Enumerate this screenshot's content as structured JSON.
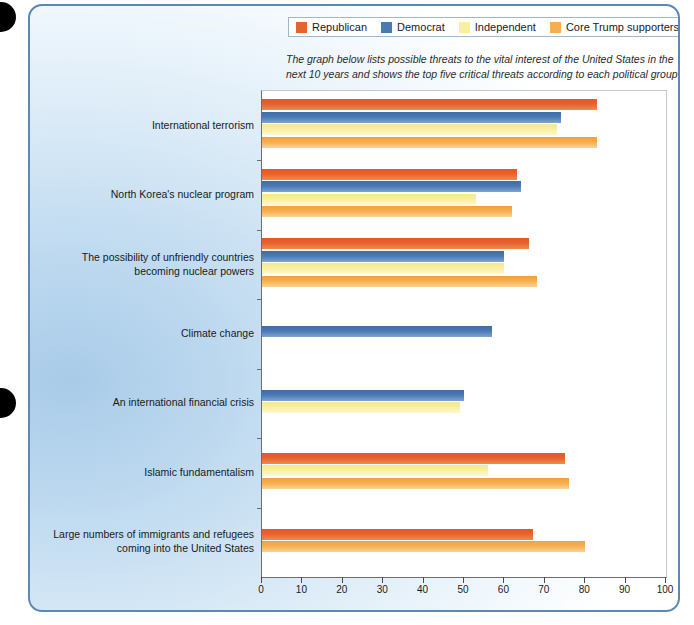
{
  "legend": {
    "items": [
      {
        "label": "Republican",
        "color": "#e4632f"
      },
      {
        "label": "Democrat",
        "color": "#4a79b4"
      },
      {
        "label": "Independent",
        "color": "#f8ef9f"
      },
      {
        "label": "Core Trump supporters",
        "color": "#f5ae51"
      }
    ]
  },
  "subtitle": "The graph below lists possible threats to the vital interest of the United States in the next 10 years and shows the top five critical threats according to each political group",
  "chart_data": {
    "type": "bar",
    "orientation": "horizontal",
    "title": "",
    "subtitle": "The graph below lists possible threats to the vital interest of the United States in the next 10 years and shows the top five critical threats according to each political group",
    "xlabel": "",
    "ylabel": "",
    "xlim": [
      0,
      100
    ],
    "xticks": [
      0,
      10,
      20,
      30,
      40,
      50,
      60,
      70,
      80,
      90,
      100
    ],
    "grid": false,
    "legend_position": "top",
    "categories": [
      "International terrorism",
      "North Korea's nuclear program",
      "The possibility of unfriendly countries becoming nuclear powers",
      "Climate change",
      "An international financial crisis",
      "Islamic fundamentalism",
      "Large numbers of immigrants and refugees coming into the United States"
    ],
    "category_lines": [
      [
        "International terrorism"
      ],
      [
        "North Korea's nuclear program"
      ],
      [
        "The possibility of unfriendly countries",
        "becoming nuclear powers"
      ],
      [
        "Climate change"
      ],
      [
        "An international financial crisis"
      ],
      [
        "Islamic fundamentalism"
      ],
      [
        "Large numbers of immigrants and refugees",
        "coming into the United States"
      ]
    ],
    "series": [
      {
        "name": "Republican",
        "color": "#e4632f",
        "values": [
          83,
          63,
          66,
          null,
          null,
          75,
          67
        ]
      },
      {
        "name": "Democrat",
        "color": "#4a79b4",
        "values": [
          74,
          64,
          60,
          57,
          50,
          null,
          null
        ]
      },
      {
        "name": "Independent",
        "color": "#f8ef9f",
        "values": [
          73,
          53,
          60,
          null,
          49,
          56,
          null
        ]
      },
      {
        "name": "Core Trump supporters",
        "color": "#f5ae51",
        "values": [
          83,
          62,
          68,
          null,
          null,
          76,
          80
        ]
      }
    ]
  },
  "xaxis": {
    "ticks": [
      "0",
      "10",
      "20",
      "30",
      "40",
      "50",
      "60",
      "70",
      "80",
      "90",
      "100"
    ]
  },
  "colors": {
    "panel_border": "#5b88b5",
    "panel_bg_start": "#a9cbe8",
    "panel_bg_end": "#ffffff",
    "plot_bg": "#ffffff",
    "axis": "#6e6e6e"
  }
}
